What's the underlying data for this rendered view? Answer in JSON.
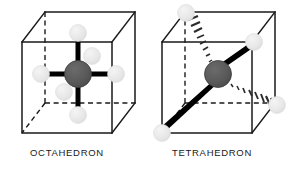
{
  "figure": {
    "title": "",
    "background_color": "#ffffff",
    "width": 290,
    "height": 171
  },
  "palette": {
    "cube_edge": "#1a1a1a",
    "bond": "#000000",
    "central_atom": "#565656",
    "central_atom_outline": "#3d3d3d",
    "ligand_atom": "#e8e8e8",
    "ligand_atom_outline": "#dcdcdc",
    "caption_text": "#1a1a1a"
  },
  "panels": [
    {
      "id": "octahedron",
      "caption": "OCTAHEDRON",
      "geometry": "octahedral",
      "coordination_number": 6,
      "central_atom": {
        "cx": 78,
        "cy": 74,
        "r": 13
      },
      "cube": {
        "front": [
          [
            22,
            42
          ],
          [
            112,
            42
          ],
          [
            112,
            133
          ],
          [
            22,
            133
          ]
        ],
        "back_offset": [
          23,
          -30
        ],
        "hidden_edges": "back-left-vertical, back-bottom-horizontal, back-left-depth"
      },
      "ligands": [
        {
          "name": "ligand-up",
          "cx": 78,
          "cy": 33,
          "r": 8.5,
          "bond": "solid"
        },
        {
          "name": "ligand-down",
          "cx": 78,
          "cy": 115,
          "r": 8.5,
          "bond": "solid"
        },
        {
          "name": "ligand-left",
          "cx": 41,
          "cy": 74,
          "r": 8.5,
          "bond": "solid"
        },
        {
          "name": "ligand-right",
          "cx": 116,
          "cy": 74,
          "r": 8.5,
          "bond": "solid"
        },
        {
          "name": "ligand-back-upper",
          "cx": 92,
          "cy": 56,
          "r": 8.5,
          "bond": "solid"
        },
        {
          "name": "ligand-front-lower",
          "cx": 64,
          "cy": 92,
          "r": 8.5,
          "bond": "solid"
        }
      ]
    },
    {
      "id": "tetrahedron",
      "caption": "TETRAHEDRON",
      "geometry": "tetrahedral",
      "coordination_number": 4,
      "central_atom": {
        "cx": 218,
        "cy": 74,
        "r": 13
      },
      "cube": {
        "front": [
          [
            162,
            42
          ],
          [
            252,
            42
          ],
          [
            252,
            133
          ],
          [
            162,
            133
          ]
        ],
        "back_offset": [
          23,
          -30
        ],
        "hidden_edges": "back-left-vertical, back-bottom-horizontal, back-left-depth"
      },
      "ligands": [
        {
          "name": "ligand-back-top-left",
          "cx": 185,
          "cy": 12,
          "r": 8.5,
          "bond": "dotted"
        },
        {
          "name": "ligand-front-top-right",
          "cx": 252,
          "cy": 42,
          "r": 8.5,
          "bond": "wedge"
        },
        {
          "name": "ligand-back-bottom-right",
          "cx": 275,
          "cy": 103,
          "r": 8.5,
          "bond": "dotted"
        },
        {
          "name": "ligand-front-bottom-left",
          "cx": 162,
          "cy": 133,
          "r": 8.5,
          "bond": "wedge"
        }
      ]
    }
  ]
}
